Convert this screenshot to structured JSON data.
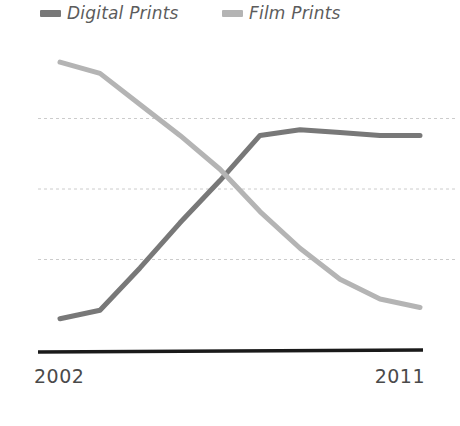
{
  "legend": {
    "position": "top-left",
    "items": [
      {
        "label": "Digital Prints",
        "color": "#787878",
        "swatch_name": "legend-swatch-digital"
      },
      {
        "label": "Film Prints",
        "color": "#b4b4b4",
        "swatch_name": "legend-swatch-film"
      }
    ]
  },
  "axis": {
    "x_tick_left": "2002",
    "x_tick_right": "2011",
    "axis_line_color": "#1a1a1a",
    "gridline_color": "#cccccc"
  },
  "chart_data": {
    "type": "line",
    "title": "",
    "subtitle": "",
    "xlabel": "",
    "ylabel": "",
    "x": [
      2002,
      2003,
      2004,
      2005,
      2006,
      2007,
      2008,
      2009,
      2010,
      2011
    ],
    "categories": [
      "2002",
      "2003",
      "2004",
      "2005",
      "2006",
      "2007",
      "2008",
      "2009",
      "2010",
      "2011"
    ],
    "xlim": [
      2002,
      2011
    ],
    "ylim": [
      0,
      100
    ],
    "grid": true,
    "gridlines_y": [
      25,
      50,
      75
    ],
    "legend_position": "top-left",
    "series": [
      {
        "name": "Digital Prints",
        "color": "#787878",
        "values": [
          4,
          7,
          22,
          38,
          53,
          69,
          71,
          70,
          69,
          69
        ]
      },
      {
        "name": "Film Prints",
        "color": "#b4b4b4",
        "values": [
          95,
          91,
          80,
          69,
          57,
          42,
          29,
          18,
          11,
          8
        ]
      }
    ],
    "annotations": [
      {
        "text": "crossover",
        "x": 2006.4,
        "y": 62
      }
    ]
  }
}
